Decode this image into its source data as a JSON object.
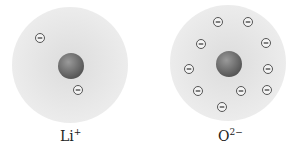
{
  "ions": [
    {
      "name": "lithium-ion",
      "symbol": "Li",
      "charge": "+",
      "cx": 70,
      "cy": 65,
      "r": 58,
      "electrons": [
        [
          40,
          38
        ],
        [
          78,
          90
        ]
      ]
    },
    {
      "name": "oxide-ion",
      "symbol": "O",
      "charge": "2−",
      "cx": 228,
      "cy": 63,
      "r": 58,
      "electrons": [
        [
          218,
          22
        ],
        [
          248,
          22
        ],
        [
          201,
          44
        ],
        [
          266,
          43
        ],
        [
          189,
          69
        ],
        [
          268,
          69
        ],
        [
          198,
          91
        ],
        [
          241,
          91
        ],
        [
          267,
          90
        ],
        [
          222,
          107
        ]
      ]
    }
  ],
  "electron_symbol": "−",
  "colors": {
    "cloud": "#e9e9e9",
    "nucleus": "#707070",
    "electron_stroke": "#444444"
  }
}
